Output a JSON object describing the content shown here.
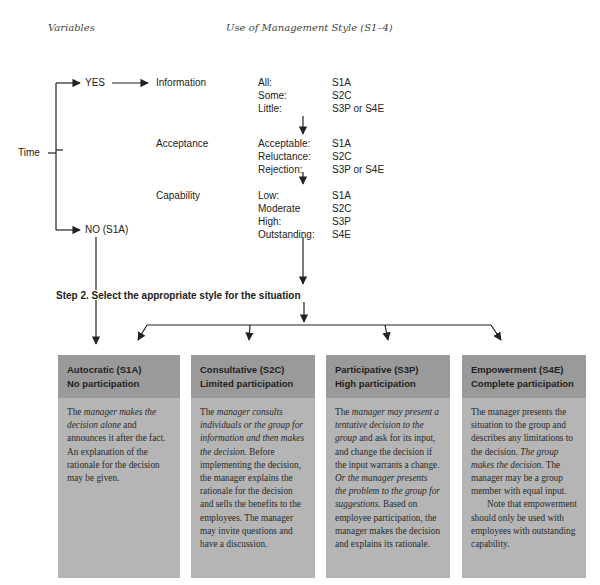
{
  "headers": {
    "variables": "Variables",
    "use_of_style": "Use of Management Style (S1–4)"
  },
  "decision": {
    "root": "Time",
    "yes": "YES",
    "no": "NO (S1A)"
  },
  "variables": [
    {
      "name": "Information",
      "levels": [
        {
          "label": "All:",
          "style": "S1A"
        },
        {
          "label": "Some:",
          "style": "S2C"
        },
        {
          "label": "Little:",
          "style": "S3P or S4E"
        }
      ]
    },
    {
      "name": "Acceptance",
      "levels": [
        {
          "label": "Acceptable:",
          "style": "S1A"
        },
        {
          "label": "Reluctance:",
          "style": "S2C"
        },
        {
          "label": "Rejection:",
          "style": "S3P or S4E"
        }
      ]
    },
    {
      "name": "Capability",
      "levels": [
        {
          "label": "Low:",
          "style": "S1A"
        },
        {
          "label": "Moderate",
          "style": "S2C"
        },
        {
          "label": "High:",
          "style": "S3P"
        },
        {
          "label": "Outstanding:",
          "style": "S4E"
        }
      ]
    }
  ],
  "step2": "Step 2. Select the appropriate style for the situation",
  "styles": [
    {
      "title": "Autocratic (S1A)",
      "subtitle": "No participation",
      "body": [
        {
          "t": "The ",
          "i": false
        },
        {
          "t": "manager makes the decision alone",
          "i": true
        },
        {
          "t": " and announces it after the fact. An explanation of the rationale for the decision may be given.",
          "i": false
        }
      ]
    },
    {
      "title": "Consultative (S2C)",
      "subtitle": "Limited participation",
      "body": [
        {
          "t": "The ",
          "i": false
        },
        {
          "t": "manager consults individuals or the group for information and then makes the decision.",
          "i": true
        },
        {
          "t": " Before implementing the decision, the manager explains the rationale for the decision and sells the benefits to the employees. The manager may invite questions and have a discussion.",
          "i": false
        }
      ]
    },
    {
      "title": "Participative (S3P)",
      "subtitle": "High participation",
      "body": [
        {
          "t": "The ",
          "i": false
        },
        {
          "t": "manager may present a tentative decision to the group",
          "i": true
        },
        {
          "t": " and ask for its input, and change the decision if the input warrants a change. ",
          "i": false
        },
        {
          "t": "Or the manager presents the problem to the group for suggestions.",
          "i": true
        },
        {
          "t": " Based on employee participation, the manager makes the decision and explains its rationale.",
          "i": false
        }
      ]
    },
    {
      "title": "Empowerment (S4E)",
      "subtitle": "Complete participation",
      "body": [
        {
          "t": "The manager presents the situation to the group and describes any limitations to the decision. ",
          "i": false
        },
        {
          "t": "The group makes the decision.",
          "i": true
        },
        {
          "t": " The manager may be a group member with equal input.",
          "i": false
        }
      ],
      "note": "Note that empowerment should only be used with employees with outstanding capability."
    }
  ],
  "colors": {
    "box_header": "#9a9a9a",
    "box_body": "#b5b5b5",
    "line": "#222222"
  }
}
